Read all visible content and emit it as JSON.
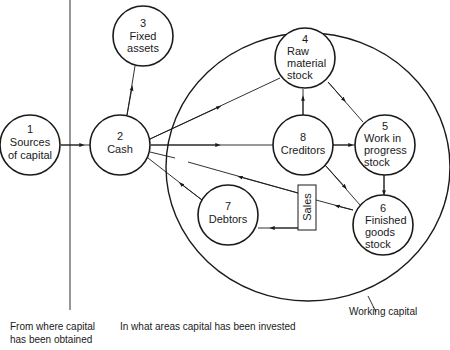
{
  "diagram": {
    "nodes": [
      {
        "id": "1",
        "number": "1",
        "lines": [
          "Sources",
          "of capital"
        ]
      },
      {
        "id": "2",
        "number": "2",
        "lines": [
          "Cash"
        ]
      },
      {
        "id": "3",
        "number": "3",
        "lines": [
          "Fixed",
          "assets"
        ]
      },
      {
        "id": "4",
        "number": "4",
        "lines": [
          "Raw",
          "material",
          "stock"
        ]
      },
      {
        "id": "5",
        "number": "5",
        "lines": [
          "Work in",
          "progress",
          "stock"
        ]
      },
      {
        "id": "6",
        "number": "6",
        "lines": [
          "Finished",
          "goods",
          "stock"
        ]
      },
      {
        "id": "7",
        "number": "7",
        "lines": [
          "Debtors"
        ]
      },
      {
        "id": "8",
        "number": "8",
        "lines": [
          "Creditors"
        ]
      }
    ],
    "sales_box": {
      "label": "Sales"
    },
    "working_capital_label": "Working capital",
    "captions": {
      "left": [
        "From where capital",
        "has been obtained"
      ],
      "right": "In what areas capital has been invested"
    },
    "edges": [
      {
        "from": "1",
        "to": "2"
      },
      {
        "from": "2",
        "to": "3"
      },
      {
        "from": "2",
        "to": "4"
      },
      {
        "from": "2",
        "to": "8"
      },
      {
        "from": "8",
        "to": "4"
      },
      {
        "from": "8",
        "to": "5"
      },
      {
        "from": "8",
        "to": "6"
      },
      {
        "from": "4",
        "to": "5"
      },
      {
        "from": "5",
        "to": "6"
      },
      {
        "from": "6",
        "to": "Sales"
      },
      {
        "from": "Sales",
        "to": "2"
      },
      {
        "from": "Sales",
        "to": "7"
      },
      {
        "from": "7",
        "to": "2"
      }
    ],
    "colors": {
      "ink": "#1a1a1a",
      "background": "#ffffff"
    }
  }
}
